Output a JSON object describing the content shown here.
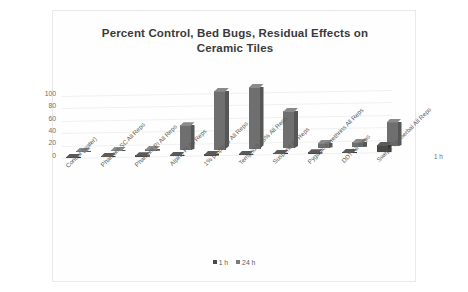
{
  "card": {
    "background": "#ffffff",
    "border_color": "#e9e9e9"
  },
  "chart_data": {
    "type": "bar",
    "title": "Percent Control, Bed Bugs, Residual Effects on Ceramic Tiles",
    "title_line1": "Percent Control, Bed Bugs, Residual Effects on",
    "title_line2": "Ceramic Tiles",
    "xlabel": "",
    "ylabel": "",
    "ylim": [
      0,
      100
    ],
    "yticks": [
      0,
      20,
      40,
      60,
      80,
      100
    ],
    "ytick_labels": [
      "0",
      "20",
      "40",
      "60",
      "80",
      "100"
    ],
    "grid": true,
    "legend_position": "bottom",
    "three_d": true,
    "z_axis_label": "1 h",
    "categories": [
      "Control (water)",
      "Phantom SC All Reps",
      "Phantom PI All Reps",
      "Alpine PI All Reps",
      "1% propoxur All Reps",
      "Temprid 0.15% All Reps",
      "Suspend All Reps",
      "Pyganic Pyrethrins All Reps",
      "DDT All Reps",
      "Swepe Tite herbal All Reps"
    ],
    "series": [
      {
        "name": "1 h",
        "color": "#4a4a4a",
        "values": [
          0,
          0,
          0,
          0,
          0,
          0,
          0,
          0,
          0,
          12
        ]
      },
      {
        "name": "24 h",
        "color": "#7a7a7a",
        "values": [
          0,
          0,
          3,
          40,
          95,
          100,
          60,
          8,
          8,
          40
        ]
      }
    ]
  },
  "legend": {
    "items": [
      {
        "label": "1 h",
        "color": "#4a4a4a"
      },
      {
        "label": "24 h",
        "color": "#7a7a7a"
      }
    ]
  }
}
